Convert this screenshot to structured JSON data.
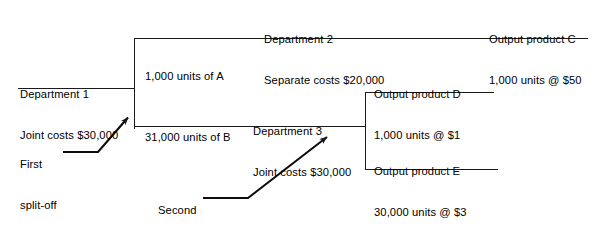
{
  "diagram": {
    "line_color": "#1a1a1a",
    "text_color": "#000000",
    "background": "#ffffff",
    "nodes": {
      "department_1": {
        "line_1": "Department 1",
        "line_2": "Joint costs $30,000"
      },
      "department_2": {
        "line_1": "Department 2",
        "line_2": "Separate costs $20,000"
      },
      "department_3": {
        "line_1": "Department 3",
        "line_2": "Joint costs $30,000"
      },
      "input_a": {
        "line_1": "1,000 units of A"
      },
      "input_b": {
        "line_1": "31,000 units of B"
      },
      "output_c": {
        "line_1": "Output product C",
        "line_2": "1,000 units @ $50"
      },
      "output_d": {
        "line_1": "Output product D",
        "line_2": "1,000 units @ $1"
      },
      "output_e": {
        "line_1": "Output product E",
        "line_2": "30,000 units @ $3"
      },
      "first_split_off": {
        "line_1": "First",
        "line_2": "split-off",
        "line_3": "point"
      },
      "second_split_off": {
        "line_1": "Second",
        "line_2": "split-off",
        "line_3": "point"
      }
    }
  }
}
